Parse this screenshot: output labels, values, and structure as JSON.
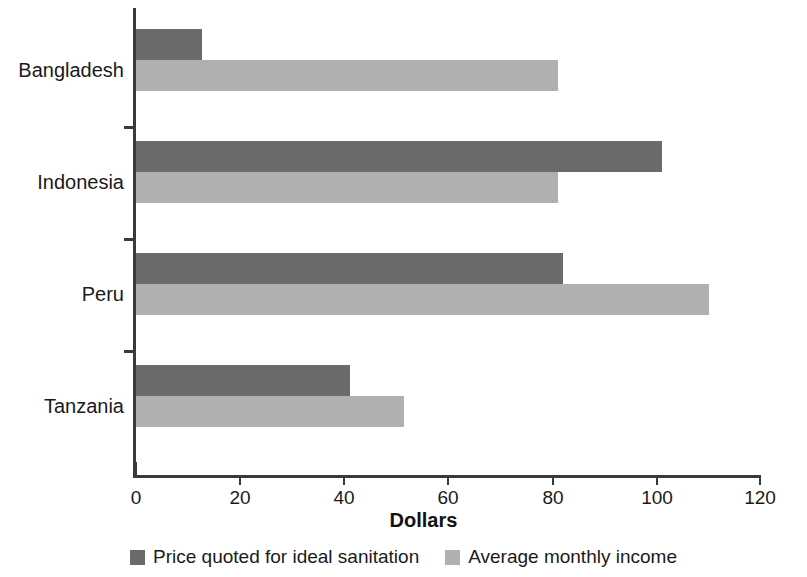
{
  "chart_data": {
    "type": "bar",
    "orientation": "horizontal",
    "title": "",
    "xlabel": "Dollars",
    "ylabel": "",
    "xlim": [
      0,
      120
    ],
    "xticks": [
      0,
      20,
      40,
      60,
      80,
      100,
      120
    ],
    "xtick_labels": [
      "0",
      "20",
      "40",
      "60",
      "80",
      "100",
      "120"
    ],
    "grid": false,
    "legend_position": "bottom",
    "categories": [
      "Bangladesh",
      "Indonesia",
      "Peru",
      "Tanzania"
    ],
    "series": [
      {
        "name": "Price quoted for ideal sanitation",
        "color": "#6a6a6a",
        "values": [
          12.7,
          101,
          82,
          41
        ]
      },
      {
        "name": "Average monthly income",
        "color": "#b0b0b0",
        "values": [
          81,
          81,
          110,
          51.5
        ]
      }
    ]
  },
  "axis": {
    "x_title": "Dollars",
    "tick_labels": [
      "0",
      "20",
      "40",
      "60",
      "80",
      "100",
      "120"
    ],
    "category_labels": [
      "Bangladesh",
      "Indonesia",
      "Peru",
      "Tanzania"
    ]
  },
  "legend": {
    "items": [
      {
        "label": "Price quoted for ideal sanitation",
        "color": "#6a6a6a"
      },
      {
        "label": "Average monthly income",
        "color": "#b0b0b0"
      }
    ]
  },
  "colors": {
    "series_dark": "#6a6a6a",
    "series_light": "#b0b0b0",
    "axis": "#3a3a3a",
    "text": "#1a1a1a",
    "background": "#ffffff"
  }
}
